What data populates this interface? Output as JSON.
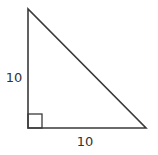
{
  "diagram": {
    "type": "right-triangle",
    "vertical_leg_label": "10",
    "horizontal_leg_label": "10",
    "right_angle_marker": true,
    "stroke_color": "#3a3a3a"
  }
}
